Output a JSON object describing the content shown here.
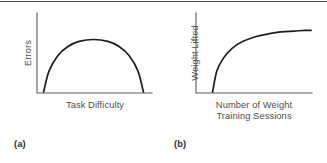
{
  "figure": {
    "background_color": "#ffffff",
    "rule_color": "#4a4a4a",
    "curve_color": "#1d1d1d",
    "axis_color": "#5a5a5a",
    "label_color": "#4d4d4d"
  },
  "panels": [
    {
      "caption": "(a)",
      "ylabel": "Errors",
      "xlabel_line1": "Task Difficulty",
      "xlabel_line2": ""
    },
    {
      "caption": "(b)",
      "ylabel": "Weight Lifted",
      "xlabel_line1": "Number of Weight",
      "xlabel_line2": "Training Sessions"
    }
  ],
  "chart_data": [
    {
      "type": "line",
      "title": "",
      "xlabel": "Task Difficulty",
      "ylabel": "Errors",
      "legend": [],
      "grid": false,
      "axis_ticks": false,
      "xlim": [
        0,
        1
      ],
      "ylim": [
        0,
        1
      ],
      "shape": "inverted-U (curvilinear)",
      "series": [
        {
          "name": "Errors vs Task Difficulty",
          "x": [
            0.05,
            0.1,
            0.18,
            0.27,
            0.37,
            0.5,
            0.63,
            0.73,
            0.82,
            0.9,
            0.95
          ],
          "y": [
            0.0,
            0.33,
            0.57,
            0.71,
            0.79,
            0.82,
            0.79,
            0.71,
            0.57,
            0.33,
            0.0
          ]
        }
      ]
    },
    {
      "type": "line",
      "title": "",
      "xlabel": "Number of Weight Training Sessions",
      "ylabel": "Weight Lifted",
      "legend": [],
      "grid": false,
      "axis_ticks": false,
      "xlim": [
        0,
        1
      ],
      "ylim": [
        0,
        1
      ],
      "shape": "negatively accelerated (decelerating growth to asymptote)",
      "series": [
        {
          "name": "Weight Lifted vs Sessions",
          "x": [
            0.08,
            0.12,
            0.18,
            0.26,
            0.36,
            0.48,
            0.6,
            0.72,
            0.84,
            0.94,
            1.0
          ],
          "y": [
            0.0,
            0.3,
            0.48,
            0.62,
            0.72,
            0.79,
            0.83,
            0.86,
            0.87,
            0.88,
            0.88
          ]
        }
      ]
    }
  ]
}
